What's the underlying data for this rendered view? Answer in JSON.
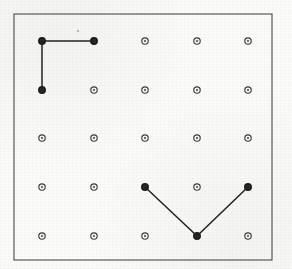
{
  "image": {
    "title": "Geoboard dot-grid figure",
    "width": 292,
    "height": 269,
    "background_color": "#fbfbfa",
    "ink_color": "#222222",
    "frame_color": "#4a4a4a",
    "peg_color": "#3a3a3a"
  },
  "board": {
    "frame": {
      "x": 14,
      "y": 14,
      "width": 258,
      "height": 246
    },
    "rows": 5,
    "columns": 5,
    "column_x": [
      42,
      94,
      145,
      197,
      248
    ],
    "row_y": [
      41,
      90,
      138,
      187,
      236
    ],
    "peg_radius": 3.2,
    "peg_inner_radius": 1.2,
    "peg_style": "open-circle"
  },
  "chart_data": {
    "type": "scatter",
    "xlabel": "",
    "ylabel": "",
    "grid": false,
    "legend": "none",
    "xlim": [
      1,
      5
    ],
    "ylim": [
      1,
      5
    ],
    "categories": [
      "col1",
      "col2",
      "col3",
      "col4",
      "col5"
    ],
    "tick_labels_x": [
      "1",
      "2",
      "3",
      "4",
      "5"
    ],
    "tick_labels_y": [
      "1",
      "2",
      "3",
      "4",
      "5"
    ],
    "pegs": [
      {
        "col": 1,
        "row": 1,
        "x": 42,
        "y": 41,
        "marked": true
      },
      {
        "col": 2,
        "row": 1,
        "x": 94,
        "y": 41,
        "marked": true
      },
      {
        "col": 3,
        "row": 1,
        "x": 145,
        "y": 41,
        "marked": false
      },
      {
        "col": 4,
        "row": 1,
        "x": 197,
        "y": 41,
        "marked": false
      },
      {
        "col": 5,
        "row": 1,
        "x": 248,
        "y": 41,
        "marked": false
      },
      {
        "col": 1,
        "row": 2,
        "x": 42,
        "y": 90,
        "marked": true
      },
      {
        "col": 2,
        "row": 2,
        "x": 94,
        "y": 90,
        "marked": false
      },
      {
        "col": 3,
        "row": 2,
        "x": 145,
        "y": 90,
        "marked": false
      },
      {
        "col": 4,
        "row": 2,
        "x": 197,
        "y": 90,
        "marked": false
      },
      {
        "col": 5,
        "row": 2,
        "x": 248,
        "y": 90,
        "marked": false
      },
      {
        "col": 1,
        "row": 3,
        "x": 42,
        "y": 138,
        "marked": false
      },
      {
        "col": 2,
        "row": 3,
        "x": 94,
        "y": 138,
        "marked": false
      },
      {
        "col": 3,
        "row": 3,
        "x": 145,
        "y": 138,
        "marked": false
      },
      {
        "col": 4,
        "row": 3,
        "x": 197,
        "y": 138,
        "marked": false
      },
      {
        "col": 5,
        "row": 3,
        "x": 248,
        "y": 138,
        "marked": false
      },
      {
        "col": 1,
        "row": 4,
        "x": 42,
        "y": 187,
        "marked": false
      },
      {
        "col": 2,
        "row": 4,
        "x": 94,
        "y": 187,
        "marked": false
      },
      {
        "col": 3,
        "row": 4,
        "x": 145,
        "y": 187,
        "marked": true
      },
      {
        "col": 4,
        "row": 4,
        "x": 197,
        "y": 187,
        "marked": false
      },
      {
        "col": 5,
        "row": 4,
        "x": 248,
        "y": 187,
        "marked": true
      },
      {
        "col": 1,
        "row": 5,
        "x": 42,
        "y": 236,
        "marked": false
      },
      {
        "col": 2,
        "row": 5,
        "x": 94,
        "y": 236,
        "marked": false
      },
      {
        "col": 3,
        "row": 5,
        "x": 145,
        "y": 236,
        "marked": false
      },
      {
        "col": 4,
        "row": 5,
        "x": 197,
        "y": 236,
        "marked": true
      },
      {
        "col": 5,
        "row": 5,
        "x": 248,
        "y": 236,
        "marked": false
      }
    ],
    "shapes": [
      {
        "name": "right-angle-figure",
        "label": "L-shape (right angle) upper left",
        "closed": false,
        "vertices": [
          {
            "col": 2,
            "row": 1,
            "x": 94,
            "y": 41
          },
          {
            "col": 1,
            "row": 1,
            "x": 42,
            "y": 41
          },
          {
            "col": 1,
            "row": 2,
            "x": 42,
            "y": 90
          }
        ]
      },
      {
        "name": "vee-figure",
        "label": "V-shape lower right",
        "closed": false,
        "vertices": [
          {
            "col": 3,
            "row": 4,
            "x": 145,
            "y": 187
          },
          {
            "col": 4,
            "row": 5,
            "x": 197,
            "y": 236
          },
          {
            "col": 5,
            "row": 4,
            "x": 248,
            "y": 187
          }
        ]
      }
    ],
    "artifacts": [
      {
        "name": "scan-speck",
        "x": 78,
        "y": 31,
        "r": 1.2
      }
    ]
  }
}
